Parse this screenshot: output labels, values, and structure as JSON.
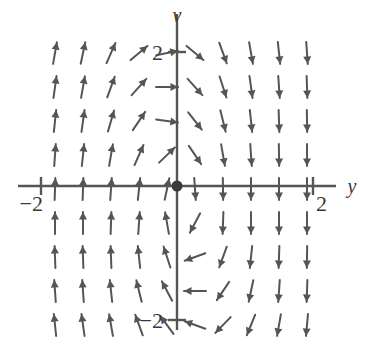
{
  "figure": {
    "kind": "direction-field",
    "background_color": "#ffffff",
    "stroke_color": "#555555",
    "axis_color": "#555555",
    "text_color": "#3a3a3a"
  },
  "axes": {
    "horizontal": {
      "name": "y-axis",
      "label": "y",
      "label_x": 352,
      "label_y": 193,
      "x_start": 18,
      "x_end": 336,
      "y": 186
    },
    "vertical": {
      "name": "v-axis",
      "label": "v",
      "label_x": 177,
      "label_y": 22,
      "y_start": 14,
      "y_end": 330,
      "x": 177
    },
    "origin": {
      "x": 177,
      "y": 186,
      "dot_radius": 5.5
    },
    "unit_px": 68
  },
  "ticks": [
    {
      "name": "tick-v-positive-2",
      "label": "2",
      "axis": "v",
      "value": 2,
      "x": 177,
      "y": 52,
      "label_x": 163,
      "label_y": 60,
      "label_anchor": "end"
    },
    {
      "name": "tick-v-negative-2",
      "label": "−2",
      "axis": "v",
      "value": -2,
      "x": 177,
      "y": 320,
      "label_x": 163,
      "label_y": 328,
      "label_anchor": "end"
    },
    {
      "name": "tick-y-positive-2",
      "label": "2",
      "axis": "y",
      "value": 2,
      "x": 313,
      "y": 186,
      "label_x": 316,
      "label_y": 211,
      "label_anchor": "start"
    },
    {
      "name": "tick-y-negative-2",
      "label": "−2",
      "axis": "y",
      "value": -2,
      "x": 41,
      "y": 186,
      "label_x": 43,
      "label_y": 211,
      "label_anchor": "end"
    }
  ],
  "chart_data": {
    "type": "scatter",
    "title": "",
    "xlabel": "y",
    "ylabel": "v",
    "xlim": [
      -2.33,
      2.33
    ],
    "ylim": [
      -2.12,
      2.53
    ],
    "grid": false,
    "legend": null,
    "grid_spec": {
      "x_start": 55,
      "x_step": 28,
      "x_count": 10,
      "y_start": 53,
      "y_step": 34,
      "y_count": 8
    },
    "arrow_length": 22,
    "arrows": [
      {
        "x": 55,
        "y": 53,
        "angle": -80
      },
      {
        "x": 83,
        "y": 53,
        "angle": -78
      },
      {
        "x": 111,
        "y": 53,
        "angle": -66
      },
      {
        "x": 139,
        "y": 53,
        "angle": -40
      },
      {
        "x": 167,
        "y": 53,
        "angle": -12
      },
      {
        "x": 195,
        "y": 53,
        "angle": 40
      },
      {
        "x": 223,
        "y": 53,
        "angle": 70
      },
      {
        "x": 251,
        "y": 53,
        "angle": 80
      },
      {
        "x": 279,
        "y": 53,
        "angle": 84
      },
      {
        "x": 307,
        "y": 53,
        "angle": 86
      },
      {
        "x": 55,
        "y": 87,
        "angle": -82
      },
      {
        "x": 83,
        "y": 87,
        "angle": -80
      },
      {
        "x": 111,
        "y": 87,
        "angle": -70
      },
      {
        "x": 139,
        "y": 87,
        "angle": -48
      },
      {
        "x": 167,
        "y": 87,
        "angle": 0
      },
      {
        "x": 195,
        "y": 87,
        "angle": 48
      },
      {
        "x": 223,
        "y": 87,
        "angle": 72
      },
      {
        "x": 251,
        "y": 87,
        "angle": 82
      },
      {
        "x": 279,
        "y": 87,
        "angle": 86
      },
      {
        "x": 307,
        "y": 87,
        "angle": 88
      },
      {
        "x": 55,
        "y": 121,
        "angle": -84
      },
      {
        "x": 83,
        "y": 121,
        "angle": -82
      },
      {
        "x": 111,
        "y": 121,
        "angle": -74
      },
      {
        "x": 139,
        "y": 121,
        "angle": -56
      },
      {
        "x": 167,
        "y": 121,
        "angle": 8
      },
      {
        "x": 195,
        "y": 121,
        "angle": 52
      },
      {
        "x": 223,
        "y": 121,
        "angle": 76
      },
      {
        "x": 251,
        "y": 121,
        "angle": 84
      },
      {
        "x": 279,
        "y": 121,
        "angle": 88
      },
      {
        "x": 307,
        "y": 121,
        "angle": 89
      },
      {
        "x": 55,
        "y": 155,
        "angle": -86
      },
      {
        "x": 83,
        "y": 155,
        "angle": -84
      },
      {
        "x": 111,
        "y": 155,
        "angle": -80
      },
      {
        "x": 139,
        "y": 155,
        "angle": -66
      },
      {
        "x": 167,
        "y": 155,
        "angle": -44
      },
      {
        "x": 195,
        "y": 155,
        "angle": 56
      },
      {
        "x": 223,
        "y": 155,
        "angle": 80
      },
      {
        "x": 251,
        "y": 155,
        "angle": 86
      },
      {
        "x": 279,
        "y": 155,
        "angle": 89
      },
      {
        "x": 307,
        "y": 155,
        "angle": 90
      },
      {
        "x": 55,
        "y": 189,
        "angle": -88
      },
      {
        "x": 83,
        "y": 189,
        "angle": -88
      },
      {
        "x": 111,
        "y": 189,
        "angle": -86
      },
      {
        "x": 139,
        "y": 189,
        "angle": -84
      },
      {
        "x": 167,
        "y": 189,
        "angle": -78
      },
      {
        "x": 195,
        "y": 189,
        "angle": 86
      },
      {
        "x": 223,
        "y": 189,
        "angle": 89
      },
      {
        "x": 251,
        "y": 189,
        "angle": 90
      },
      {
        "x": 279,
        "y": 189,
        "angle": 90
      },
      {
        "x": 307,
        "y": 189,
        "angle": 90
      },
      {
        "x": 55,
        "y": 223,
        "angle": -90
      },
      {
        "x": 83,
        "y": 223,
        "angle": -90
      },
      {
        "x": 111,
        "y": 223,
        "angle": -88
      },
      {
        "x": 139,
        "y": 223,
        "angle": -86
      },
      {
        "x": 167,
        "y": 223,
        "angle": -100
      },
      {
        "x": 195,
        "y": 223,
        "angle": 118
      },
      {
        "x": 223,
        "y": 223,
        "angle": 92
      },
      {
        "x": 251,
        "y": 223,
        "angle": 90
      },
      {
        "x": 279,
        "y": 223,
        "angle": 90
      },
      {
        "x": 307,
        "y": 223,
        "angle": 90
      },
      {
        "x": 55,
        "y": 257,
        "angle": -92
      },
      {
        "x": 83,
        "y": 257,
        "angle": -92
      },
      {
        "x": 111,
        "y": 257,
        "angle": -92
      },
      {
        "x": 139,
        "y": 257,
        "angle": -96
      },
      {
        "x": 167,
        "y": 257,
        "angle": -108
      },
      {
        "x": 195,
        "y": 257,
        "angle": 160
      },
      {
        "x": 223,
        "y": 257,
        "angle": 110
      },
      {
        "x": 251,
        "y": 257,
        "angle": 96
      },
      {
        "x": 279,
        "y": 257,
        "angle": 92
      },
      {
        "x": 307,
        "y": 257,
        "angle": 91
      },
      {
        "x": 55,
        "y": 291,
        "angle": -94
      },
      {
        "x": 83,
        "y": 291,
        "angle": -94
      },
      {
        "x": 111,
        "y": 291,
        "angle": -96
      },
      {
        "x": 139,
        "y": 291,
        "angle": -104
      },
      {
        "x": 167,
        "y": 291,
        "angle": -118
      },
      {
        "x": 195,
        "y": 291,
        "angle": 180
      },
      {
        "x": 223,
        "y": 291,
        "angle": 124
      },
      {
        "x": 251,
        "y": 291,
        "angle": 102
      },
      {
        "x": 279,
        "y": 291,
        "angle": 94
      },
      {
        "x": 307,
        "y": 291,
        "angle": 92
      },
      {
        "x": 55,
        "y": 325,
        "angle": -96
      },
      {
        "x": 83,
        "y": 325,
        "angle": -98
      },
      {
        "x": 111,
        "y": 325,
        "angle": -100
      },
      {
        "x": 139,
        "y": 325,
        "angle": -110
      },
      {
        "x": 167,
        "y": 325,
        "angle": -126
      },
      {
        "x": 195,
        "y": 325,
        "angle": 200
      },
      {
        "x": 223,
        "y": 325,
        "angle": 134
      },
      {
        "x": 251,
        "y": 325,
        "angle": 112
      },
      {
        "x": 279,
        "y": 325,
        "angle": 100
      },
      {
        "x": 307,
        "y": 325,
        "angle": 95
      }
    ]
  }
}
